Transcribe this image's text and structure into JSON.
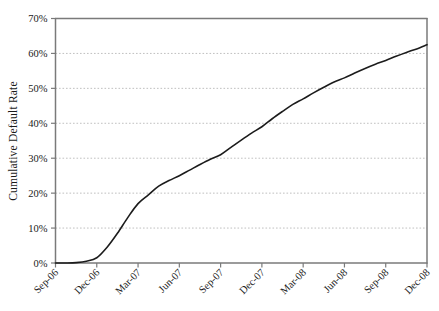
{
  "chart_data": {
    "type": "line",
    "title": "",
    "xlabel": "",
    "ylabel": "Cumulative Default Rate",
    "ylim": [
      0,
      70
    ],
    "yunit": "%",
    "grid": true,
    "legend": "none",
    "line_color": "#1c1c1c",
    "axis_color": "#7a7a7a",
    "grid_color": "#b9b9b9",
    "background": "#ffffff",
    "categories": [
      "Sep-06",
      "Dec-06",
      "Mar-07",
      "Jun-07",
      "Sep-07",
      "Dec-07",
      "Mar-08",
      "Jun-08",
      "Sep-08",
      "Dec-08"
    ],
    "ytick_labels": [
      "0%",
      "10%",
      "20%",
      "30%",
      "40%",
      "50%",
      "60%",
      "70%"
    ],
    "ytick_values": [
      0,
      10,
      20,
      30,
      40,
      50,
      60,
      70
    ],
    "series": [
      {
        "name": "Cumulative Default Rate",
        "values": [
          0,
          1.5,
          17,
          25,
          31,
          39,
          47,
          53,
          58,
          62.5
        ],
        "x": [
          "Sep-06",
          "Dec-06",
          "Mar-07",
          "Jun-07",
          "Sep-07",
          "Dec-07",
          "Mar-08",
          "Jun-08",
          "Sep-08",
          "Dec-08"
        ],
        "dense_points": [
          {
            "x": 0.0,
            "y": 0.0
          },
          {
            "x": 0.25,
            "y": 0.0
          },
          {
            "x": 0.5,
            "y": 0.1
          },
          {
            "x": 0.75,
            "y": 0.5
          },
          {
            "x": 1.0,
            "y": 1.5
          },
          {
            "x": 1.25,
            "y": 4.5
          },
          {
            "x": 1.5,
            "y": 8.5
          },
          {
            "x": 1.75,
            "y": 13.0
          },
          {
            "x": 2.0,
            "y": 17.0
          },
          {
            "x": 2.25,
            "y": 19.5
          },
          {
            "x": 2.5,
            "y": 22.0
          },
          {
            "x": 2.75,
            "y": 23.6
          },
          {
            "x": 3.0,
            "y": 25.0
          },
          {
            "x": 3.25,
            "y": 26.6
          },
          {
            "x": 3.5,
            "y": 28.2
          },
          {
            "x": 3.75,
            "y": 29.7
          },
          {
            "x": 4.0,
            "y": 31.0
          },
          {
            "x": 4.25,
            "y": 33.1
          },
          {
            "x": 4.5,
            "y": 35.2
          },
          {
            "x": 4.75,
            "y": 37.2
          },
          {
            "x": 5.0,
            "y": 39.0
          },
          {
            "x": 5.25,
            "y": 41.3
          },
          {
            "x": 5.5,
            "y": 43.4
          },
          {
            "x": 5.75,
            "y": 45.4
          },
          {
            "x": 6.0,
            "y": 47.0
          },
          {
            "x": 6.25,
            "y": 48.7
          },
          {
            "x": 6.5,
            "y": 50.3
          },
          {
            "x": 6.75,
            "y": 51.8
          },
          {
            "x": 7.0,
            "y": 53.0
          },
          {
            "x": 7.25,
            "y": 54.4
          },
          {
            "x": 7.5,
            "y": 55.7
          },
          {
            "x": 7.75,
            "y": 56.9
          },
          {
            "x": 8.0,
            "y": 58.0
          },
          {
            "x": 8.25,
            "y": 59.2
          },
          {
            "x": 8.5,
            "y": 60.3
          },
          {
            "x": 8.75,
            "y": 61.3
          },
          {
            "x": 9.0,
            "y": 62.5
          }
        ]
      }
    ]
  }
}
